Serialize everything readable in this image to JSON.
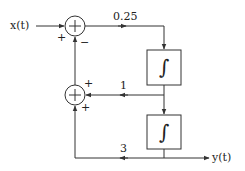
{
  "diagram": {
    "type": "block-diagram",
    "colors": {
      "line": "#333333",
      "background": "#ffffff"
    },
    "input": {
      "label": "x(t)"
    },
    "output": {
      "label": "y(t)"
    },
    "summing_junctions": [
      {
        "id": "sum1",
        "symbol": "+",
        "input_signs": {
          "left": "+",
          "bottom": "−"
        }
      },
      {
        "id": "sum2",
        "symbol": "+",
        "input_signs": {
          "right": "+",
          "bottom": "+"
        }
      }
    ],
    "gains": [
      {
        "id": "gain_forward",
        "label": "0.25"
      },
      {
        "id": "gain_feedback_inner",
        "label": "1"
      },
      {
        "id": "gain_feedback_outer",
        "label": "3"
      }
    ],
    "blocks": [
      {
        "id": "integrator1",
        "symbol": "∫"
      },
      {
        "id": "integrator2",
        "symbol": "∫"
      }
    ]
  }
}
